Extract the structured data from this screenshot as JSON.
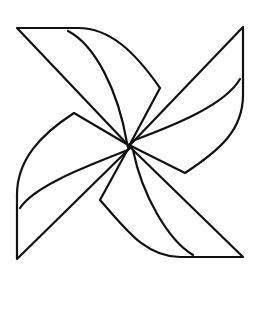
{
  "figure": {
    "description": "Black outline drawing of a four-bladed pinwheel on a white background",
    "background_color": "#ffffff",
    "stroke_color": "#111111",
    "stroke_width": 2.2,
    "center": [
      129,
      146
    ],
    "blades": [
      {
        "name": "top-left-blade",
        "outline": "M129,146 L17,28 L78,28 C110,28 135,52 160,88 L129,146",
        "inner_curve": "M68,31 C95,45 118,90 127,143"
      },
      {
        "name": "top-right-blade",
        "outline": "M131,144 L243,27 L243,95 C243,130 220,150 185,173 L131,146",
        "inner_curve": "M240,79 C225,105 175,125 132,141"
      },
      {
        "name": "left-blade",
        "outline": "M130,148 L17,259 L17,195 C17,160 40,135 74,113 L130,146",
        "inner_curve": "M20,208 C35,185 90,165 128,150"
      },
      {
        "name": "bottom-blade",
        "outline": "M131,148 L243,257 L180,257 C145,257 125,228 100,200 L128,149",
        "inner_curve": "M193,255 C168,240 142,195 133,150"
      }
    ]
  }
}
